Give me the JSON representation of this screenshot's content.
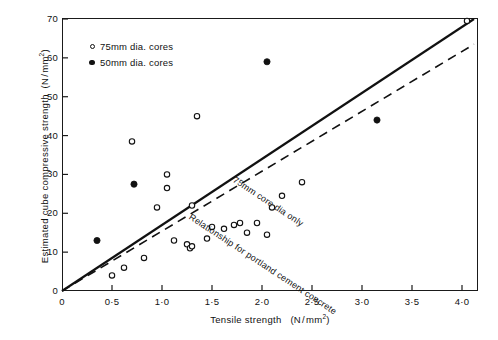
{
  "chart_data": {
    "type": "scatter",
    "title": "",
    "xlabel": "Tensile strength (N/mm2)",
    "ylabel": "Estimated cube compressive strength (N/mm2)",
    "xlim": [
      0,
      4.2
    ],
    "ylim": [
      0,
      70
    ],
    "xticks": [
      0,
      0.5,
      1.0,
      1.5,
      2.0,
      2.5,
      3.0,
      3.5,
      4.0
    ],
    "xticklabels": [
      "0",
      "0·5",
      "1·0",
      "1·5",
      "2·0",
      "2·5",
      "3·0",
      "3·5",
      "4·0"
    ],
    "yticks": [
      0,
      10,
      20,
      30,
      40,
      50,
      60,
      70
    ],
    "yticklabels": [
      "0",
      "10",
      "20",
      "30",
      "40",
      "50",
      "60",
      "70"
    ],
    "grid": false,
    "legend_position": "upper-left-inside",
    "series": [
      {
        "name": "75mm dia. cores",
        "marker": "open-circle",
        "color": "#111111",
        "points": [
          [
            0.7,
            38.5
          ],
          [
            1.05,
            30.0
          ],
          [
            1.05,
            26.5
          ],
          [
            1.35,
            45.0
          ],
          [
            0.95,
            21.5
          ],
          [
            1.3,
            22.0
          ],
          [
            1.5,
            16.5
          ],
          [
            1.62,
            16.0
          ],
          [
            1.12,
            13.0
          ],
          [
            1.25,
            12.0
          ],
          [
            1.28,
            11.0
          ],
          [
            1.3,
            11.5
          ],
          [
            1.45,
            13.5
          ],
          [
            1.72,
            17.0
          ],
          [
            1.78,
            17.5
          ],
          [
            1.95,
            17.5
          ],
          [
            1.85,
            15.0
          ],
          [
            2.05,
            14.5
          ],
          [
            2.1,
            21.5
          ],
          [
            2.2,
            24.5
          ],
          [
            2.4,
            28.0
          ],
          [
            0.82,
            8.5
          ],
          [
            0.62,
            6.0
          ],
          [
            0.5,
            4.0
          ],
          [
            4.05,
            69.5
          ]
        ]
      },
      {
        "name": "50mm dia. cores",
        "marker": "filled-circle",
        "color": "#111111",
        "points": [
          [
            0.35,
            13.0
          ],
          [
            0.72,
            27.5
          ],
          [
            2.05,
            59.0
          ],
          [
            3.15,
            44.0
          ]
        ]
      }
    ],
    "lines": [
      {
        "name": "75mm core dia only",
        "style": "solid",
        "label": "75mm core dia only",
        "from": [
          0.0,
          0.0
        ],
        "to": [
          4.12,
          70.0
        ]
      },
      {
        "name": "Relationship for portland cement concrete",
        "style": "dashed",
        "label": "Relationship for portland cement concrete",
        "from": [
          0.0,
          0.0
        ],
        "to": [
          4.12,
          63.5
        ]
      }
    ]
  },
  "axes": {
    "x_title_main": "Tensile strength",
    "x_title_units_a": "(N",
    "x_title_units_b": "mm",
    "x_title_units_exp": "2",
    "x_title_units_c": ")",
    "y_title_main": "Estimated cube compressive strength",
    "y_title_units_a": "(N",
    "y_title_units_b": "mm",
    "y_title_units_exp": "2",
    "y_title_units_c": ")",
    "slash": "/"
  },
  "legend": {
    "items": [
      {
        "marker": "open-circle",
        "label": "75mm  dia. cores"
      },
      {
        "marker": "filled-circle",
        "label": "50mm  dia. cores"
      }
    ]
  },
  "annotations": {
    "solid_line_label": "75mm core dia only",
    "dashed_line_label": "Relationship for portland cement concrete"
  },
  "colors": {
    "ink": "#111111",
    "background": "#ffffff"
  }
}
